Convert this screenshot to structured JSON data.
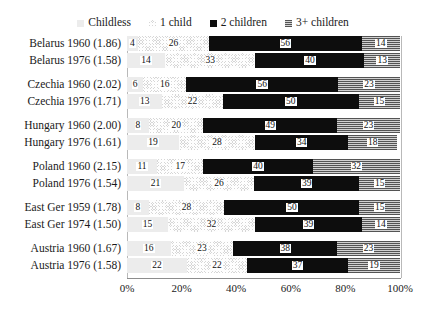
{
  "legend": {
    "items": [
      {
        "label": "Childless",
        "key": "childless",
        "swatch": "light-gray-swatch"
      },
      {
        "label": "1 child",
        "key": "one",
        "swatch": "checkered-swatch"
      },
      {
        "label": "2 children",
        "key": "two",
        "swatch": "black-swatch"
      },
      {
        "label": "3+ children",
        "key": "three",
        "swatch": "striped-gray-swatch"
      }
    ]
  },
  "axis": {
    "xticks": [
      "0%",
      "20%",
      "40%",
      "60%",
      "80%",
      "100%"
    ],
    "xvalues": [
      0,
      20,
      40,
      60,
      80,
      100
    ],
    "xmin": 0,
    "xmax": 100
  },
  "colors": {
    "childless": "#ececec",
    "one_child": "#d6d6d6",
    "two_children": "#0d0d0d",
    "three_plus": "#9a9a9a",
    "axis": "#b9b9b9",
    "text": "#1a1a1a"
  },
  "chart_data": {
    "type": "bar",
    "orientation": "horizontal",
    "stacked": true,
    "title": "",
    "xlabel": "",
    "ylabel": "",
    "xlim": [
      0,
      100
    ],
    "grid": false,
    "legend_position": "top",
    "categories": [
      "Belarus 1960 (1.86)",
      "Belarus 1976 (1.58)",
      "Czechia 1960 (2.02)",
      "Czechia 1976 (1.71)",
      "Hungary 1960 (2.00)",
      "Hungary 1976 (1.61)",
      "Poland 1960 (2.15)",
      "Poland 1976 (1.54)",
      "East Ger 1959 (1.78)",
      "East Ger 1974 (1.50)",
      "Austria 1960 (1.67)",
      "Austria 1976 (1.58)"
    ],
    "series": [
      {
        "name": "Childless",
        "values": [
          4,
          14,
          6,
          13,
          8,
          19,
          11,
          21,
          8,
          15,
          16,
          22
        ]
      },
      {
        "name": "1 child",
        "values": [
          26,
          33,
          16,
          22,
          20,
          28,
          17,
          26,
          28,
          32,
          23,
          22
        ]
      },
      {
        "name": "2 children",
        "values": [
          56,
          40,
          56,
          50,
          49,
          34,
          40,
          39,
          50,
          39,
          38,
          37
        ]
      },
      {
        "name": "3+ children",
        "values": [
          14,
          13,
          23,
          15,
          23,
          18,
          32,
          15,
          15,
          14,
          23,
          19
        ]
      }
    ]
  },
  "groups": [
    {
      "rows": [
        0,
        1
      ]
    },
    {
      "rows": [
        2,
        3
      ]
    },
    {
      "rows": [
        4,
        5
      ]
    },
    {
      "rows": [
        6,
        7
      ]
    },
    {
      "rows": [
        8,
        9
      ]
    },
    {
      "rows": [
        10,
        11
      ]
    }
  ]
}
